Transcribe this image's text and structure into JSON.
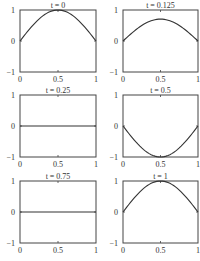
{
  "chart_data": [
    {
      "type": "line",
      "title": "t = 0",
      "x": [
        0,
        0.125,
        0.25,
        0.375,
        0.5,
        0.625,
        0.75,
        0.875,
        1
      ],
      "values": [
        0,
        0.383,
        0.707,
        0.924,
        1,
        0.924,
        0.707,
        0.383,
        0
      ],
      "xlim": [
        0,
        1
      ],
      "ylim": [
        -1,
        1
      ],
      "xticks": [
        "0",
        "0.5",
        "1"
      ],
      "yticks": [
        "−1",
        "0",
        "1"
      ]
    },
    {
      "type": "line",
      "title": "t = 0.125",
      "x": [
        0,
        0.125,
        0.25,
        0.375,
        0.5,
        0.625,
        0.75,
        0.875,
        1
      ],
      "values": [
        0,
        0.271,
        0.5,
        0.653,
        0.707,
        0.653,
        0.5,
        0.271,
        0
      ],
      "xlim": [
        0,
        1
      ],
      "ylim": [
        -1,
        1
      ],
      "xticks": [
        "0",
        "0.5",
        "1"
      ],
      "yticks": [
        "−1",
        "0",
        "1"
      ]
    },
    {
      "type": "line",
      "title": "t = 0.25",
      "x": [
        0,
        0.125,
        0.25,
        0.375,
        0.5,
        0.625,
        0.75,
        0.875,
        1
      ],
      "values": [
        0,
        0,
        0,
        0,
        0,
        0,
        0,
        0,
        0
      ],
      "xlim": [
        0,
        1
      ],
      "ylim": [
        -1,
        1
      ],
      "xticks": [
        "0",
        "0.5",
        "1"
      ],
      "yticks": [
        "−1",
        "0",
        "1"
      ]
    },
    {
      "type": "line",
      "title": "t = 0.5",
      "x": [
        0,
        0.125,
        0.25,
        0.375,
        0.5,
        0.625,
        0.75,
        0.875,
        1
      ],
      "values": [
        0,
        -0.383,
        -0.707,
        -0.924,
        -1,
        -0.924,
        -0.707,
        -0.383,
        0
      ],
      "xlim": [
        0,
        1
      ],
      "ylim": [
        -1,
        1
      ],
      "xticks": [
        "0",
        "0.5",
        "1"
      ],
      "yticks": [
        "−1",
        "0",
        "1"
      ]
    },
    {
      "type": "line",
      "title": "t = 0.75",
      "x": [
        0,
        0.125,
        0.25,
        0.375,
        0.5,
        0.625,
        0.75,
        0.875,
        1
      ],
      "values": [
        0,
        0,
        0,
        0,
        0,
        0,
        0,
        0,
        0
      ],
      "xlim": [
        0,
        1
      ],
      "ylim": [
        -1,
        1
      ],
      "xticks": [
        "0",
        "0.5",
        "1"
      ],
      "yticks": [
        "−1",
        "0",
        "1"
      ]
    },
    {
      "type": "line",
      "title": "t = 1",
      "x": [
        0,
        0.125,
        0.25,
        0.375,
        0.5,
        0.625,
        0.75,
        0.875,
        1
      ],
      "values": [
        0,
        0.383,
        0.707,
        0.924,
        1,
        0.924,
        0.707,
        0.383,
        0
      ],
      "xlim": [
        0,
        1
      ],
      "ylim": [
        -1,
        1
      ],
      "xticks": [
        "0",
        "0.5",
        "1"
      ],
      "yticks": [
        "−1",
        "0",
        "1"
      ]
    }
  ],
  "panels": [
    {
      "title": "t = 0"
    },
    {
      "title": "t = 0.125"
    },
    {
      "title": "t = 0.25"
    },
    {
      "title": "t = 0.5"
    },
    {
      "title": "t = 0.75"
    },
    {
      "title": "t = 1"
    }
  ],
  "ticks": {
    "x0": "0",
    "x_mid": "0.5",
    "x1": "1",
    "y_top": "1",
    "y_mid": "0",
    "y_bot": "−1"
  },
  "colors": {
    "line": "#333333",
    "axis": "#444444"
  }
}
